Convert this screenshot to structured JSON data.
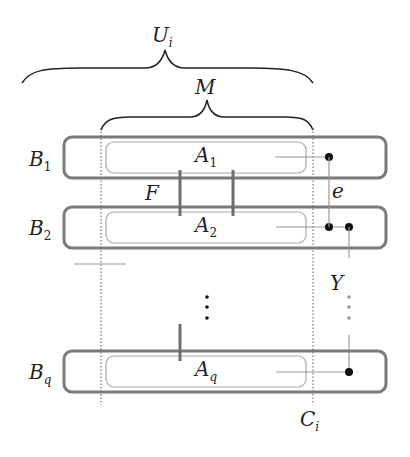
{
  "diagram": {
    "labels": {
      "U": "U",
      "U_sub": "i",
      "M": "M",
      "F": "F",
      "e": "e",
      "Y": "Y",
      "C": "C",
      "C_sub": "i"
    },
    "rows": [
      {
        "outer": "B",
        "outer_sub": "1",
        "inner": "A",
        "inner_sub": "1"
      },
      {
        "outer": "B",
        "outer_sub": "2",
        "inner": "A",
        "inner_sub": "2"
      },
      {
        "outer": "B",
        "outer_sub": "q",
        "inner": "A",
        "inner_sub": "q"
      }
    ],
    "ellipsis": "⋮",
    "colors": {
      "outer_box": "#7a7a7a",
      "inner_box": "#a8a8a8",
      "bar": "#6e6e6e",
      "brace": "#222222",
      "dot": "#111111",
      "grey_dot": "#999999",
      "dotted_line": "#555555"
    }
  }
}
